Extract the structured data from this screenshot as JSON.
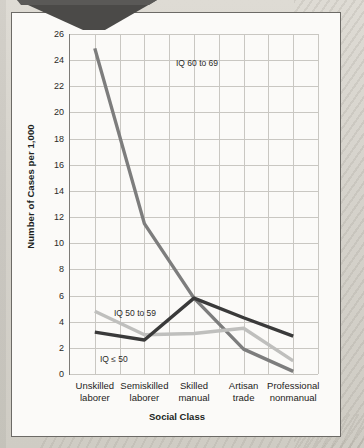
{
  "figure": {
    "callout_tab": "callout-tab-shape"
  },
  "chart_data": {
    "type": "line",
    "title": "",
    "xlabel": "Social Class",
    "ylabel": "Number of Cases per 1,000",
    "categories": [
      "Unskilled laborer",
      "Semiskilled laborer",
      "Skilled manual",
      "Artisan trade",
      "Professional nonmanual"
    ],
    "category_lines": [
      [
        "Unskilled",
        "laborer"
      ],
      [
        "Semiskilled",
        "laborer"
      ],
      [
        "Skilled",
        "manual"
      ],
      [
        "Artisan",
        "trade"
      ],
      [
        "Professional",
        "nonmanual"
      ]
    ],
    "ylim": [
      0,
      26
    ],
    "yticks": [
      0,
      2,
      4,
      6,
      8,
      10,
      12,
      14,
      16,
      18,
      20,
      22,
      24,
      26
    ],
    "grid": true,
    "legend": "inline-annotations",
    "series": [
      {
        "name": "IQ 60 to 69",
        "color": "#7d7d7d",
        "values": [
          24.9,
          11.5,
          5.8,
          1.9,
          0.2
        ]
      },
      {
        "name": "IQ 50 to 59",
        "color": "#bfbfbd",
        "values": [
          4.8,
          3.0,
          3.1,
          3.5,
          1.0
        ]
      },
      {
        "name": "IQ ≤ 50",
        "color": "#3a3a3a",
        "values": [
          3.2,
          2.6,
          5.8,
          4.3,
          2.9
        ]
      }
    ],
    "annotations": [
      {
        "text": "IQ 60 to 69",
        "x_px": 106,
        "y_px": 24
      },
      {
        "text": "IQ 50 to 59",
        "x_px": 44,
        "y_px": 274
      },
      {
        "text": "IQ ≤ 50",
        "x_px": 30,
        "y_px": 320
      }
    ]
  }
}
